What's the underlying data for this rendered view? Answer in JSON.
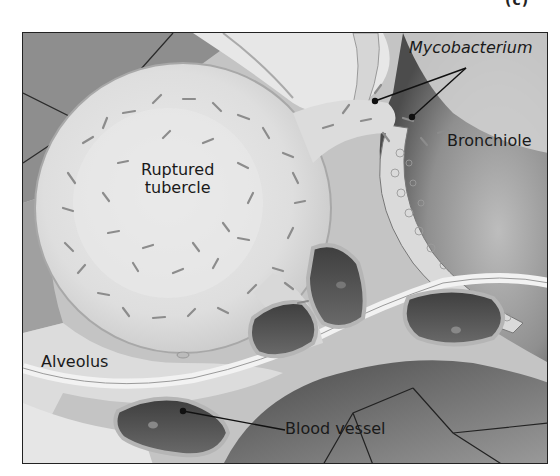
{
  "figure": {
    "panel_label": "(c)",
    "labels": {
      "mycobacterium": "Mycobacterium",
      "bronchiole": "Bronchiole",
      "ruptured_tubercle_line1": "Ruptured",
      "ruptured_tubercle_line2": "tubercle",
      "alveolus": "Alveolus",
      "blood_vessel": "Blood vessel"
    },
    "colors": {
      "frame": "#222222",
      "tissue_light": "#ececec",
      "tissue_dark": "#5a5a5a",
      "bacteria": "#8a8a8a",
      "text": "#1a1a1a"
    }
  }
}
